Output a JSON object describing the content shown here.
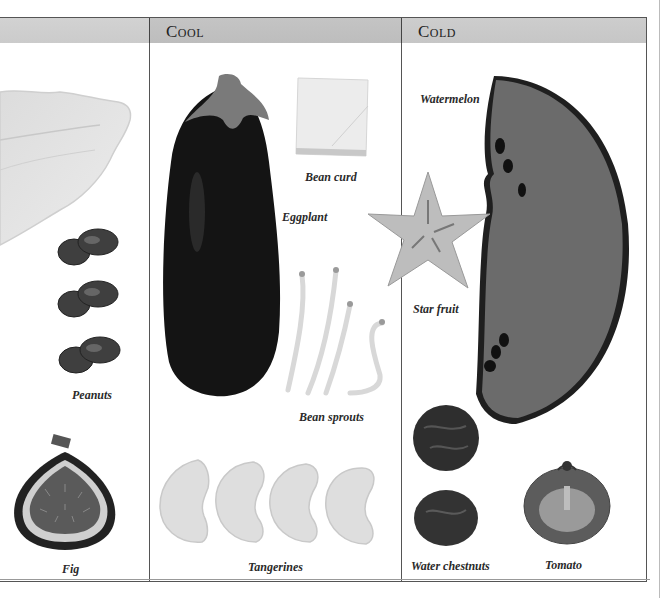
{
  "page": {
    "top_text_fragment": "... ... ... ... ...",
    "columns": [
      {
        "id": "left",
        "label": ""
      },
      {
        "id": "cool",
        "label": "Cool"
      },
      {
        "id": "cold",
        "label": "Cold"
      }
    ]
  },
  "left_column": {
    "items": [
      {
        "name": "cabbage-leaf",
        "caption": ""
      },
      {
        "name": "peanuts",
        "caption": "Peanuts"
      },
      {
        "name": "fig",
        "caption": "Fig"
      }
    ]
  },
  "cool_column": {
    "items": [
      {
        "name": "eggplant",
        "caption": "Eggplant"
      },
      {
        "name": "bean-curd",
        "caption": "Bean curd"
      },
      {
        "name": "bean-sprouts",
        "caption": "Bean sprouts"
      },
      {
        "name": "tangerines",
        "caption": "Tangerines"
      }
    ]
  },
  "cold_column": {
    "items": [
      {
        "name": "watermelon",
        "caption": "Watermelon"
      },
      {
        "name": "star-fruit",
        "caption": "Star fruit"
      },
      {
        "name": "water-chestnuts",
        "caption": "Water chestnuts"
      },
      {
        "name": "tomato",
        "caption": "Tomato"
      }
    ]
  },
  "colors": {
    "header_left": "#cfcfcf",
    "header_cool": "#c1c1c1",
    "header_cold": "#cacaca",
    "rule": "#555555"
  }
}
